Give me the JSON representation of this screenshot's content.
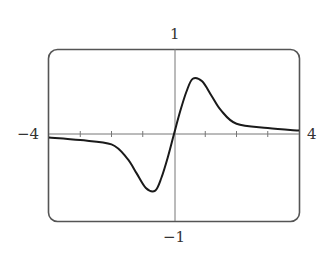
{
  "chart_data": {
    "type": "line",
    "title": "",
    "xlabel": "",
    "ylabel": "",
    "xlim": [
      -4,
      4
    ],
    "ylim": [
      -1,
      1
    ],
    "x_tick_step": 1,
    "grid": false,
    "legend": null,
    "window_labels": {
      "xmin": "−4",
      "xmax": "4",
      "ymax": "1",
      "ymin": "−1"
    },
    "series": [
      {
        "name": "f(x)",
        "x": [
          -4,
          -3,
          -2,
          -1.5,
          -1.2,
          -0.9,
          -0.6,
          -0.4,
          -0.2,
          0,
          0.2,
          0.4,
          0.6,
          0.9,
          1.2,
          1.5,
          2,
          3,
          4
        ],
        "y": [
          -0.04,
          -0.07,
          -0.12,
          -0.28,
          -0.45,
          -0.62,
          -0.65,
          -0.5,
          -0.27,
          0,
          0.27,
          0.5,
          0.65,
          0.62,
          0.45,
          0.28,
          0.12,
          0.07,
          0.04
        ]
      }
    ]
  },
  "colors": {
    "frame": "#555555",
    "axis": "#666666",
    "curve": "#1a1a1a"
  }
}
